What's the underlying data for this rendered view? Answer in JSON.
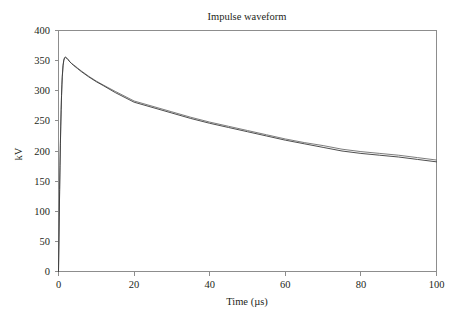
{
  "chart_data": {
    "type": "line",
    "title": "Impulse waveform",
    "xlabel": "Time (µs)",
    "ylabel": "kV",
    "xlim": [
      0,
      100
    ],
    "ylim": [
      0,
      400
    ],
    "xticks": [
      0,
      20,
      40,
      60,
      80,
      100
    ],
    "yticks": [
      0,
      50,
      100,
      150,
      200,
      250,
      300,
      350,
      400
    ],
    "xticklabels": [
      "0",
      "20",
      "40",
      "60",
      "80",
      "100"
    ],
    "yticklabels": [
      "0",
      "50",
      "100",
      "150",
      "200",
      "250",
      "300",
      "350",
      "400"
    ],
    "grid": false,
    "legend": "none",
    "line_color": "#3a3a3a",
    "frame_color": "#8d8d8d",
    "x": [
      0,
      0.1,
      0.2,
      0.3,
      0.4,
      0.5,
      0.6,
      0.7,
      0.8,
      0.9,
      1.0,
      1.2,
      1.4,
      1.6,
      1.8,
      2.0,
      2.2,
      2.5,
      3.0,
      3.5,
      4.0,
      5.0,
      6.0,
      8.0,
      10.0,
      12.0,
      15.0,
      20.0,
      25.0,
      30.0,
      35.0,
      40.0,
      45.0,
      50.0,
      55.0,
      60.0,
      65.0,
      70.0,
      75.0,
      80.0,
      85.0,
      90.0,
      95.0,
      100.0
    ],
    "series": [
      {
        "name": "measured",
        "values": [
          0,
          44,
          92,
          136,
          176,
          212,
          243,
          269,
          292,
          310,
          324,
          342,
          351,
          355,
          356,
          355,
          354,
          352,
          348,
          345,
          342,
          337,
          332,
          323,
          315,
          308,
          297,
          281,
          272,
          263,
          254,
          246,
          239,
          232,
          225,
          218,
          212,
          206,
          200,
          196,
          193,
          190,
          186,
          182
        ]
      },
      {
        "name": "simulated",
        "values": [
          0,
          42,
          89,
          133,
          173,
          209,
          241,
          267,
          290,
          308,
          322,
          341,
          350,
          354,
          355,
          355,
          354,
          352,
          348,
          345,
          343,
          338,
          333,
          324,
          316,
          309,
          299,
          283,
          274,
          265,
          256,
          248,
          241,
          234,
          227,
          220,
          214,
          209,
          203,
          199,
          196,
          193,
          189,
          185
        ]
      }
    ],
    "peak_value": 356,
    "peak_time": 1.8,
    "final_value": 182
  }
}
